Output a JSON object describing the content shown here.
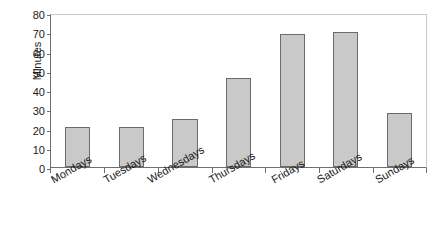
{
  "chart_data": {
    "type": "bar",
    "title": "",
    "subtitle": "",
    "xlabel": "",
    "ylabel": "Minutes",
    "categories": [
      "Mondays",
      "Tuesdays",
      "Wednesdays",
      "Thursdays",
      "Fridays",
      "Saturdays",
      "Sundays"
    ],
    "values": [
      21,
      21,
      25,
      46,
      69,
      70,
      28
    ],
    "ylim": [
      0,
      80
    ],
    "yticks": [
      0,
      10,
      20,
      30,
      40,
      50,
      60,
      70,
      80
    ],
    "ytick_labels": [
      "0",
      "10",
      "20",
      "30",
      "40",
      "50",
      "60",
      "70",
      "80"
    ],
    "grid": false,
    "legend": false,
    "legend_position": "none",
    "bar_fill_color": "#c9c9c9",
    "bar_border_color": "#6b6b6b",
    "axis_color": "#6e6e6e",
    "frame_color": "#c9c9c9",
    "text_color": "#1a1a1a",
    "background_color": "#ffffff",
    "xtick_label_rotation": -30
  }
}
